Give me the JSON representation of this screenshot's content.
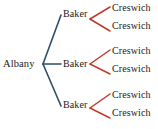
{
  "diagram": {
    "type": "tree-diagram",
    "background_color": "#ffffff",
    "colors": {
      "level1_branch": "#2d4f66",
      "level2_branch": "#c0392b",
      "text": "#1a1a1a"
    },
    "root": {
      "label": "Albany",
      "x": 3,
      "y": 58
    },
    "level1": [
      {
        "label": "Baker",
        "x": 63,
        "y": 8
      },
      {
        "label": "Baker",
        "x": 63,
        "y": 58
      },
      {
        "label": "Baker",
        "x": 63,
        "y": 99
      }
    ],
    "level2": [
      {
        "label": "Creswich",
        "x": 112,
        "y": 2
      },
      {
        "label": "Creswich",
        "x": 112,
        "y": 20
      },
      {
        "label": "Creswich",
        "x": 112,
        "y": 45
      },
      {
        "label": "Creswich",
        "x": 112,
        "y": 63
      },
      {
        "label": "Creswich",
        "x": 112,
        "y": 89
      },
      {
        "label": "Creswich",
        "x": 112,
        "y": 107
      }
    ],
    "branches_level1": [
      {
        "x1": 43,
        "y1": 64,
        "x2": 61,
        "y2": 15
      },
      {
        "x1": 43,
        "y1": 64,
        "x2": 61,
        "y2": 64
      },
      {
        "x1": 43,
        "y1": 64,
        "x2": 61,
        "y2": 106
      }
    ],
    "branches_level2": [
      {
        "x1": 90,
        "y1": 19,
        "x2": 110,
        "y2": 7
      },
      {
        "x1": 90,
        "y1": 19,
        "x2": 110,
        "y2": 31
      },
      {
        "x1": 90,
        "y1": 64,
        "x2": 110,
        "y2": 50
      },
      {
        "x1": 90,
        "y1": 64,
        "x2": 110,
        "y2": 74
      },
      {
        "x1": 90,
        "y1": 108,
        "x2": 110,
        "y2": 94
      },
      {
        "x1": 90,
        "y1": 108,
        "x2": 110,
        "y2": 118
      }
    ]
  }
}
